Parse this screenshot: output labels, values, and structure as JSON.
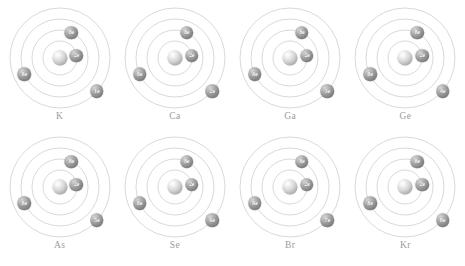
{
  "figure": {
    "background_color": "#ffffff",
    "ring_color": "#c9c9c9",
    "nucleus_color": "#b5b5b5",
    "electron_color": "#8a8a8a",
    "label_color": "#9b9b9b",
    "columns": 4,
    "rows": 2
  },
  "chart_data": {
    "type": "diagram",
    "atoms": [
      {
        "symbol": "K",
        "shells": [
          {
            "label": "2e",
            "electrons": 2,
            "ring": 1,
            "angle_deg": 8
          },
          {
            "label": "8e",
            "electrons": 8,
            "ring": 2,
            "angle_deg": 65
          },
          {
            "label": "8e",
            "electrons": 8,
            "ring": 3,
            "angle_deg": 205
          },
          {
            "label": "1e",
            "electrons": 1,
            "ring": 4,
            "angle_deg": -42
          }
        ]
      },
      {
        "symbol": "Ca",
        "shells": [
          {
            "label": "2e",
            "electrons": 2,
            "ring": 1,
            "angle_deg": 8
          },
          {
            "label": "8e",
            "electrons": 8,
            "ring": 2,
            "angle_deg": 65
          },
          {
            "label": "8e",
            "electrons": 8,
            "ring": 3,
            "angle_deg": 205
          },
          {
            "label": "2e",
            "electrons": 2,
            "ring": 4,
            "angle_deg": -42
          }
        ]
      },
      {
        "symbol": "Ga",
        "shells": [
          {
            "label": "2e",
            "electrons": 2,
            "ring": 1,
            "angle_deg": 8
          },
          {
            "label": "8e",
            "electrons": 8,
            "ring": 2,
            "angle_deg": 65
          },
          {
            "label": "8e",
            "electrons": 8,
            "ring": 3,
            "angle_deg": 205
          },
          {
            "label": "3e",
            "electrons": 3,
            "ring": 4,
            "angle_deg": -42
          }
        ]
      },
      {
        "symbol": "Ge",
        "shells": [
          {
            "label": "2e",
            "electrons": 2,
            "ring": 1,
            "angle_deg": 8
          },
          {
            "label": "8e",
            "electrons": 8,
            "ring": 2,
            "angle_deg": 65
          },
          {
            "label": "8e",
            "electrons": 8,
            "ring": 3,
            "angle_deg": 205
          },
          {
            "label": "4e",
            "electrons": 4,
            "ring": 4,
            "angle_deg": -42
          }
        ]
      },
      {
        "symbol": "As",
        "shells": [
          {
            "label": "2e",
            "electrons": 2,
            "ring": 1,
            "angle_deg": 8
          },
          {
            "label": "8e",
            "electrons": 8,
            "ring": 2,
            "angle_deg": 65
          },
          {
            "label": "8e",
            "electrons": 8,
            "ring": 3,
            "angle_deg": 205
          },
          {
            "label": "5e",
            "electrons": 5,
            "ring": 4,
            "angle_deg": -42
          }
        ]
      },
      {
        "symbol": "Se",
        "shells": [
          {
            "label": "2e",
            "electrons": 2,
            "ring": 1,
            "angle_deg": 8
          },
          {
            "label": "8e",
            "electrons": 8,
            "ring": 2,
            "angle_deg": 65
          },
          {
            "label": "8e",
            "electrons": 8,
            "ring": 3,
            "angle_deg": 205
          },
          {
            "label": "6e",
            "electrons": 6,
            "ring": 4,
            "angle_deg": -42
          }
        ]
      },
      {
        "symbol": "Br",
        "shells": [
          {
            "label": "2e",
            "electrons": 2,
            "ring": 1,
            "angle_deg": 8
          },
          {
            "label": "8e",
            "electrons": 8,
            "ring": 2,
            "angle_deg": 65
          },
          {
            "label": "8e",
            "electrons": 8,
            "ring": 3,
            "angle_deg": 205
          },
          {
            "label": "7e",
            "electrons": 7,
            "ring": 4,
            "angle_deg": -42
          }
        ]
      },
      {
        "symbol": "Kr",
        "shells": [
          {
            "label": "2e",
            "electrons": 2,
            "ring": 1,
            "angle_deg": 8
          },
          {
            "label": "8e",
            "electrons": 8,
            "ring": 2,
            "angle_deg": 65
          },
          {
            "label": "8e",
            "electrons": 8,
            "ring": 3,
            "angle_deg": 205
          },
          {
            "label": "8e",
            "electrons": 8,
            "ring": 4,
            "angle_deg": -42
          }
        ]
      }
    ],
    "ring_radii_px": [
      17,
      28,
      39,
      50
    ]
  }
}
